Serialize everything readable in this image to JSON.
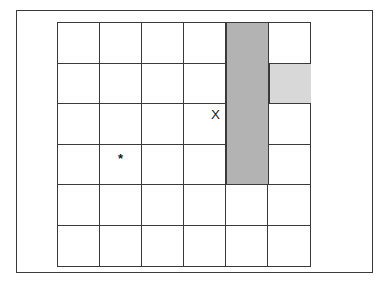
{
  "figure": {
    "name": "grid-diagram",
    "grid": {
      "columns": 6,
      "rows": 6,
      "cell_ids": [
        [
          "r1c1",
          "r1c2",
          "r1c3",
          "r1c4",
          "r1c5",
          "r1c6"
        ],
        [
          "r2c1",
          "r2c2",
          "r2c3",
          "r2c4",
          "r2c5",
          "r2c6"
        ],
        [
          "r3c1",
          "r3c2",
          "r3c3",
          "r3c4",
          "r3c5",
          "r3c6"
        ],
        [
          "r4c1",
          "r4c2",
          "r4c3",
          "r4c4",
          "r4c5",
          "r4c6"
        ],
        [
          "r5c1",
          "r5c2",
          "r5c3",
          "r5c4",
          "r5c5",
          "r5c6"
        ],
        [
          "r6c1",
          "r6c2",
          "r6c3",
          "r6c4",
          "r6c5",
          "r6c6"
        ]
      ]
    },
    "markers": {
      "x_marker": {
        "label": "X",
        "row": 3,
        "column": 4
      },
      "star_marker": {
        "label": "*",
        "row": 4,
        "column": 2
      }
    },
    "shading": {
      "dark_block": {
        "label": "",
        "column": 5,
        "row_start": 1,
        "row_end": 4,
        "color": "#b3b3b3"
      },
      "light_cell": {
        "label": "",
        "column": 6,
        "row": 2,
        "color": "#d8d8d8"
      }
    },
    "colors": {
      "background": "#ffffff",
      "line": "#3a3a3a",
      "dark_shade": "#b3b3b3",
      "light_shade": "#d8d8d8",
      "marker_text": "#1a1a1a"
    }
  }
}
